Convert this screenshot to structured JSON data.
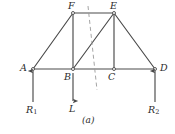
{
  "figure": {
    "caption": "(a)",
    "type": "truss-free-body-diagram",
    "stroke_color": "#4a4a4a",
    "dash_color": "#9a9a9a",
    "text_color": "#2b2b2b",
    "joints": [
      {
        "id": "A",
        "label": "A",
        "x": 33,
        "y": 69,
        "label_x": 20,
        "label_y": 63,
        "support": true
      },
      {
        "id": "B",
        "label": "B",
        "x": 73,
        "y": 69,
        "label_x": 64,
        "label_y": 72,
        "support": false
      },
      {
        "id": "C",
        "label": "C",
        "x": 114,
        "y": 69,
        "label_x": 108,
        "label_y": 72,
        "support": false
      },
      {
        "id": "D",
        "label": "D",
        "x": 155,
        "y": 69,
        "label_x": 160,
        "label_y": 63,
        "support": true
      },
      {
        "id": "E",
        "label": "E",
        "x": 114,
        "y": 13,
        "label_x": 110,
        "label_y": 1,
        "support": false
      },
      {
        "id": "F",
        "label": "F",
        "x": 73,
        "y": 13,
        "label_x": 68,
        "label_y": 1,
        "support": false
      }
    ],
    "members": [
      {
        "name": "member-A-F",
        "from": "A",
        "to": "F"
      },
      {
        "name": "member-A-B",
        "from": "A",
        "to": "B"
      },
      {
        "name": "member-F-B",
        "from": "F",
        "to": "B"
      },
      {
        "name": "member-F-E",
        "from": "F",
        "to": "E"
      },
      {
        "name": "member-B-E",
        "from": "B",
        "to": "E"
      },
      {
        "name": "member-B-C",
        "from": "B",
        "to": "C"
      },
      {
        "name": "member-E-C",
        "from": "E",
        "to": "C"
      },
      {
        "name": "member-E-D",
        "from": "E",
        "to": "D"
      },
      {
        "name": "member-C-D",
        "from": "C",
        "to": "D"
      }
    ],
    "section_line": {
      "name": "section-cut-line",
      "x1": 88,
      "y1": 6,
      "x2": 97,
      "y2": 90,
      "dash": "4 3"
    },
    "forces": [
      {
        "id": "R1",
        "name": "reaction-R1",
        "label": "R",
        "subscript": "1",
        "direction": "up",
        "x": 33,
        "tail_y": 102,
        "head_y": 71,
        "label_x": 26,
        "label_y": 105
      },
      {
        "id": "L",
        "name": "load-L",
        "label": "L",
        "subscript": "",
        "direction": "down",
        "x": 73,
        "tail_y": 73,
        "head_y": 101,
        "label_x": 69,
        "label_y": 104
      },
      {
        "id": "R2",
        "name": "reaction-R2",
        "label": "R",
        "subscript": "2",
        "direction": "up",
        "x": 155,
        "tail_y": 102,
        "head_y": 71,
        "label_x": 148,
        "label_y": 105
      }
    ]
  }
}
